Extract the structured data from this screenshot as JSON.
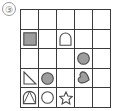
{
  "panel": {
    "item_number": "③",
    "grid": {
      "rows": 5,
      "cols": 5,
      "line_color": "#3b3b3b",
      "fill_color": "#9d9d9d",
      "outline_color": "#4a4a4a",
      "background": "#ffffff",
      "cells": [
        [
          {
            "row": 1,
            "col": 1,
            "shape": "empty",
            "style": "none"
          },
          {
            "row": 1,
            "col": 2,
            "shape": "empty",
            "style": "none"
          },
          {
            "row": 1,
            "col": 3,
            "shape": "empty",
            "style": "none"
          },
          {
            "row": 1,
            "col": 4,
            "shape": "empty",
            "style": "none"
          },
          {
            "row": 1,
            "col": 5,
            "shape": "empty",
            "style": "none"
          }
        ],
        [
          {
            "row": 2,
            "col": 1,
            "shape": "square",
            "style": "filled"
          },
          {
            "row": 2,
            "col": 2,
            "shape": "empty",
            "style": "none"
          },
          {
            "row": 2,
            "col": 3,
            "shape": "arch",
            "style": "outline"
          },
          {
            "row": 2,
            "col": 4,
            "shape": "empty",
            "style": "none"
          },
          {
            "row": 2,
            "col": 5,
            "shape": "empty",
            "style": "none"
          }
        ],
        [
          {
            "row": 3,
            "col": 1,
            "shape": "empty",
            "style": "none"
          },
          {
            "row": 3,
            "col": 2,
            "shape": "empty",
            "style": "none"
          },
          {
            "row": 3,
            "col": 3,
            "shape": "empty",
            "style": "none"
          },
          {
            "row": 3,
            "col": 4,
            "shape": "circle",
            "style": "filled"
          },
          {
            "row": 3,
            "col": 5,
            "shape": "empty",
            "style": "none"
          }
        ],
        [
          {
            "row": 4,
            "col": 1,
            "shape": "right-triangle",
            "style": "outline"
          },
          {
            "row": 4,
            "col": 2,
            "shape": "circle",
            "style": "filled"
          },
          {
            "row": 4,
            "col": 3,
            "shape": "empty",
            "style": "none"
          },
          {
            "row": 4,
            "col": 4,
            "shape": "heart",
            "style": "filled"
          },
          {
            "row": 4,
            "col": 5,
            "shape": "empty",
            "style": "none"
          }
        ],
        [
          {
            "row": 5,
            "col": 1,
            "shape": "arch-overlap",
            "style": "outline"
          },
          {
            "row": 5,
            "col": 2,
            "shape": "circle",
            "style": "outline"
          },
          {
            "row": 5,
            "col": 3,
            "shape": "star",
            "style": "outline"
          },
          {
            "row": 5,
            "col": 4,
            "shape": "empty",
            "style": "none"
          },
          {
            "row": 5,
            "col": 5,
            "shape": "empty",
            "style": "none"
          }
        ]
      ]
    }
  }
}
